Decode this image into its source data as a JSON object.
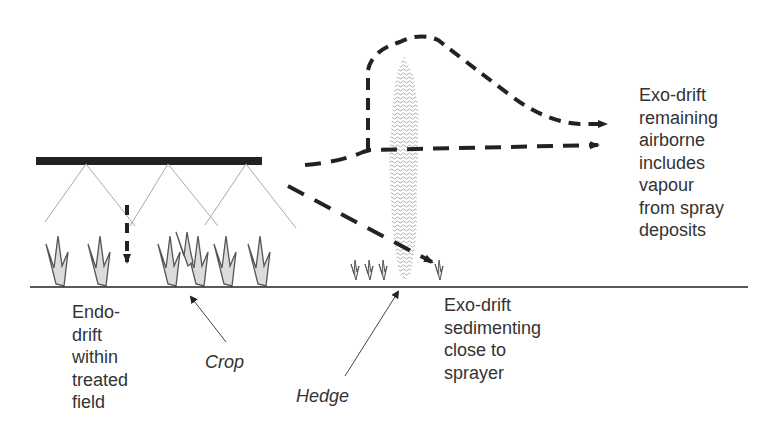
{
  "diagram": {
    "labels": {
      "exo_airborne": "Exo-drift\nremaining\nairborne\nincludes\nvapour\nfrom spray\ndeposits",
      "exo_sediment": "Exo-drift\nsedimenting\nclose to\nsprayer",
      "endo": "Endo-\ndrift\nwithin\ntreated\nfield",
      "crop": "Crop",
      "hedge": "Hedge"
    },
    "colors": {
      "ink": "#222222",
      "text": "#333333",
      "plant_fill": "#dcdcdc",
      "spray_fan": "#aaaaaa",
      "hedge_fill": "#c8c8c8"
    }
  }
}
